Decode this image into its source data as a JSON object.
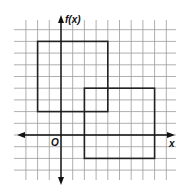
{
  "diagram": {
    "type": "coordinate-grid",
    "y_axis_label": "f(x)",
    "x_axis_label": "x",
    "origin_label": "O",
    "grid": {
      "x_min": -3,
      "x_max": 9,
      "y_min": -3,
      "y_max": 9
    },
    "shapes": [
      {
        "name": "square-1",
        "x1": -2,
        "y1": 2,
        "x2": 4,
        "y2": 8
      },
      {
        "name": "square-2",
        "x1": 2,
        "y1": -2,
        "x2": 8,
        "y2": 4
      }
    ],
    "colors": {
      "grid": "#9a9a9a",
      "axis": "#111111",
      "shape": "#222222"
    }
  }
}
